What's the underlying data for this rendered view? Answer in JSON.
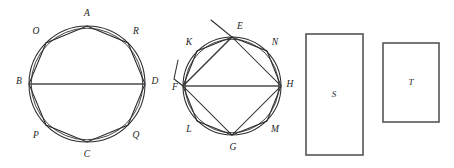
{
  "figure": {
    "background_color": "#ffffff",
    "stroke_color": "#2b2b2b",
    "rect_stroke_color": "#555555",
    "diameter_color": "#4a4a4a",
    "panels": [
      {
        "id": "panel-octagon-abcd",
        "kind": "circle-with-inscribed-octagon",
        "circle": {
          "cx": 87,
          "cy": 84,
          "r": 58
        },
        "diameter": {
          "from": "B",
          "to": "D"
        },
        "vertices": [
          {
            "name": "A",
            "x": 87,
            "y": 26,
            "label_x": 87,
            "label_y": 14,
            "angle_deg": 270
          },
          {
            "name": "R",
            "x": 128,
            "y": 43,
            "label_x": 136,
            "label_y": 32,
            "angle_deg": 315
          },
          {
            "name": "D",
            "x": 145,
            "y": 84,
            "label_x": 155,
            "label_y": 82,
            "angle_deg": 0
          },
          {
            "name": "Q",
            "x": 128,
            "y": 125,
            "label_x": 136,
            "label_y": 136,
            "angle_deg": 45
          },
          {
            "name": "C",
            "x": 87,
            "y": 142,
            "label_x": 87,
            "label_y": 155,
            "angle_deg": 90
          },
          {
            "name": "P",
            "x": 46,
            "y": 125,
            "label_x": 36,
            "label_y": 136,
            "angle_deg": 135
          },
          {
            "name": "B",
            "x": 29,
            "y": 84,
            "label_x": 19,
            "label_y": 82,
            "angle_deg": 180
          },
          {
            "name": "O",
            "x": 46,
            "y": 43,
            "label_x": 36,
            "label_y": 32,
            "angle_deg": 225
          }
        ]
      },
      {
        "id": "panel-octagon-efgh",
        "kind": "circle-with-inscribed-square-octagon-and-tilted-square",
        "circle": {
          "cx": 232,
          "cy": 86,
          "r": 49
        },
        "diameter": {
          "from": "F",
          "to": "H"
        },
        "inner_square": [
          "E",
          "H",
          "G",
          "F"
        ],
        "vertices": [
          {
            "name": "E",
            "x": 232,
            "y": 37,
            "label_x": 240,
            "label_y": 27,
            "angle_deg": 270
          },
          {
            "name": "N",
            "x": 267,
            "y": 51,
            "label_x": 275,
            "label_y": 43,
            "angle_deg": 315
          },
          {
            "name": "H",
            "x": 281,
            "y": 86,
            "label_x": 290,
            "label_y": 85,
            "angle_deg": 0
          },
          {
            "name": "M",
            "x": 267,
            "y": 121,
            "label_x": 275,
            "label_y": 130,
            "angle_deg": 45
          },
          {
            "name": "G",
            "x": 232,
            "y": 135,
            "label_x": 233,
            "label_y": 148,
            "angle_deg": 90
          },
          {
            "name": "L",
            "x": 197,
            "y": 121,
            "label_x": 189,
            "label_y": 130,
            "angle_deg": 135
          },
          {
            "name": "F",
            "x": 183,
            "y": 86,
            "label_x": 175,
            "label_y": 88,
            "angle_deg": 180
          },
          {
            "name": "K",
            "x": 197,
            "y": 51,
            "label_x": 189,
            "label_y": 43,
            "angle_deg": 225
          }
        ],
        "tilted_square": {
          "points": [
            {
              "x": 211,
              "y": 20
            },
            {
              "x": 232,
              "y": 37
            },
            {
              "x": 183,
              "y": 86
            },
            {
              "x": 174,
              "y": 79
            },
            {
              "x": 178,
              "y": 60
            }
          ],
          "note": "outer construction square partly outside circle at upper-left"
        }
      },
      {
        "id": "panel-rect-s",
        "kind": "rectangle",
        "label": "S",
        "x": 306,
        "y": 34,
        "width": 57,
        "height": 121,
        "label_x": 334,
        "label_y": 95
      },
      {
        "id": "panel-rect-t",
        "kind": "rectangle",
        "label": "T",
        "x": 383,
        "y": 43,
        "width": 56,
        "height": 79,
        "label_x": 411,
        "label_y": 83
      }
    ]
  }
}
